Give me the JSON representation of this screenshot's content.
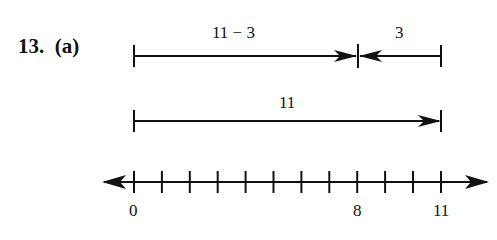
{
  "problem": {
    "number": "13.",
    "part": "(a)"
  },
  "diagram": {
    "arrow_top_left_label": "11 − 3",
    "arrow_top_right_label": "3",
    "arrow_middle_label": "11",
    "number_line": {
      "min_tick": 0,
      "max_tick": 11,
      "tick_count": 12,
      "labels": [
        {
          "value": 0,
          "text": "0"
        },
        {
          "value": 8,
          "text": "8"
        },
        {
          "value": 11,
          "text": "11"
        }
      ]
    }
  }
}
